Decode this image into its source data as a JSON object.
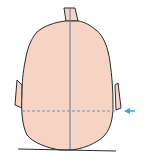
{
  "diagram": {
    "colors": {
      "skin": "#f7d3c3",
      "outline": "#2b2b2b",
      "midline": "#4a7fa8",
      "dashed_line": "#7f8fa0",
      "arrow": "#3aa7d9",
      "ground": "#2b2b2b"
    },
    "elements": {
      "midline": "vertical-midline",
      "dashed_line": "horizontal-dashed-reference-line",
      "arrow": "arrow-pointing-left"
    }
  }
}
